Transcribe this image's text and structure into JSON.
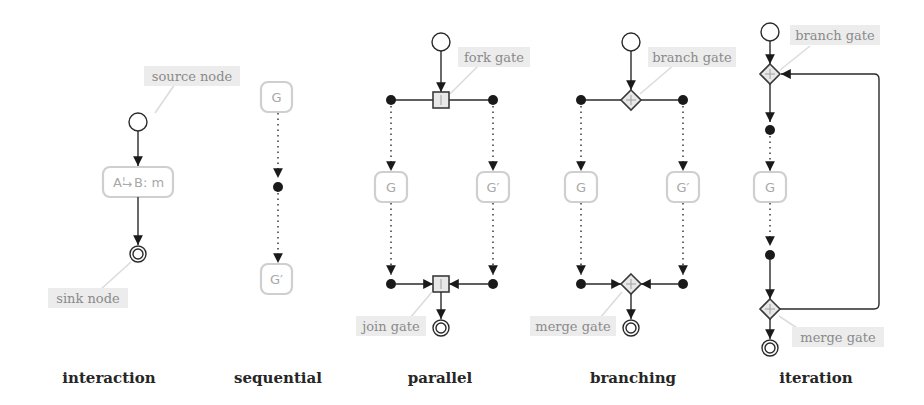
{
  "diagram": {
    "captions": {
      "interaction": "interaction",
      "sequential": "sequential",
      "parallel": "parallel",
      "branching": "branching",
      "iteration": "iteration"
    },
    "interaction": {
      "node_label_left": "A",
      "node_label_arrow_sup": "!",
      "node_label_right": "B: m",
      "source_note": "source node",
      "sink_note": "sink node"
    },
    "sequential": {
      "node_top": "G",
      "node_bottom": "G′"
    },
    "parallel": {
      "node_left": "G",
      "node_right": "G′",
      "fork_note": "fork gate",
      "join_note": "join gate",
      "gate_symbol": "|"
    },
    "branching": {
      "node_left": "G",
      "node_right": "G′",
      "branch_note": "branch gate",
      "merge_note": "merge gate",
      "gate_symbol": "+"
    },
    "iteration": {
      "node": "G",
      "branch_note": "branch gate",
      "merge_note": "merge gate",
      "gate_symbol": "+"
    },
    "colors": {
      "edge": "#2a2a2a",
      "node_border": "#cfcfcf",
      "note_background": "#ececec",
      "caption": "#262626"
    }
  }
}
